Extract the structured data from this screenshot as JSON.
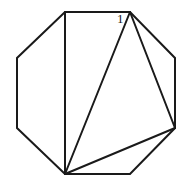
{
  "figure": {
    "kind": "polygon-triangulation-diagram",
    "shape_name": "octagon",
    "background_color": "#ffffff",
    "stroke_color": "#1a1a1a",
    "stroke_width": 2,
    "canvas": {
      "width": 194,
      "height": 189
    },
    "vertices": [
      {
        "id": "v-top-left",
        "x": 65,
        "y": 12
      },
      {
        "id": "v-top-right",
        "x": 130,
        "y": 12
      },
      {
        "id": "v-right-upper",
        "x": 175,
        "y": 58
      },
      {
        "id": "v-right-lower",
        "x": 175,
        "y": 128
      },
      {
        "id": "v-bottom-right",
        "x": 130,
        "y": 174
      },
      {
        "id": "v-bottom-left",
        "x": 65,
        "y": 174
      },
      {
        "id": "v-left-lower",
        "x": 17,
        "y": 128
      },
      {
        "id": "v-left-upper",
        "x": 17,
        "y": 58
      }
    ],
    "outline_points": "65,12 130,12 175,58 175,128 130,174 65,174 17,128 17,58",
    "chords": [
      {
        "id": "chord-left-vertical",
        "from": "v-top-left",
        "to": "v-bottom-left",
        "d": "M 65 12 L 65 174"
      },
      {
        "id": "chord-main-diagonal",
        "from": "v-top-right",
        "to": "v-bottom-left",
        "d": "M 130 12 L 65 174"
      },
      {
        "id": "chord-right-diagonal",
        "from": "v-top-right",
        "to": "v-right-lower",
        "d": "M 130 12 L 175 128"
      },
      {
        "id": "chord-lower-diagonal",
        "from": "v-right-lower",
        "to": "v-bottom-left",
        "d": "M 175 128 L 65 174"
      }
    ],
    "labels": [
      {
        "id": "label-1",
        "text": "1",
        "anchor_vertex": "v-top-right",
        "x": 117,
        "y": 12
      }
    ]
  }
}
